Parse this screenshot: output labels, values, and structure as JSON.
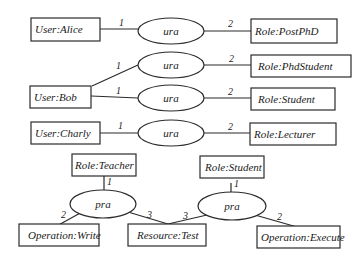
{
  "diagram": {
    "nodes": {
      "user_alice": "User:Alice",
      "user_bob": "User:Bob",
      "user_charly": "User:Charly",
      "role_postphd": "Role:PostPhD",
      "role_phdstudent": "Role:PhdStudent",
      "role_student": "Role:Student",
      "role_lecturer": "Role:Lecturer",
      "role_teacher": "Role:Teacher",
      "role_student2": "Role:Student",
      "op_write": "Operation:Write",
      "resource_test": "Resource:Test",
      "op_execute": "Operation:Execute"
    },
    "relations": {
      "ura": "ura",
      "pra": "pra"
    },
    "multiplicities": {
      "one": "1",
      "two": "2",
      "three": "3"
    },
    "edges": [
      {
        "from": "User:Alice",
        "to": "ura",
        "label": "1"
      },
      {
        "from": "ura",
        "to": "Role:PostPhD",
        "label": "2"
      },
      {
        "from": "User:Bob",
        "to": "ura",
        "label": "1"
      },
      {
        "from": "ura",
        "to": "Role:PhdStudent",
        "label": "2"
      },
      {
        "from": "User:Bob",
        "to": "ura",
        "label": "1"
      },
      {
        "from": "ura",
        "to": "Role:Student",
        "label": "2"
      },
      {
        "from": "User:Charly",
        "to": "ura",
        "label": "1"
      },
      {
        "from": "ura",
        "to": "Role:Lecturer",
        "label": "2"
      },
      {
        "from": "Role:Teacher",
        "to": "pra",
        "label": "1"
      },
      {
        "from": "pra",
        "to": "Operation:Write",
        "label": "2"
      },
      {
        "from": "pra",
        "to": "Resource:Test",
        "label": "3"
      },
      {
        "from": "Role:Student",
        "to": "pra",
        "label": "1"
      },
      {
        "from": "pra",
        "to": "Resource:Test",
        "label": "3"
      },
      {
        "from": "pra",
        "to": "Operation:Execute",
        "label": "2"
      }
    ]
  }
}
